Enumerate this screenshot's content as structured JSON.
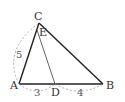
{
  "diagram": {
    "type": "triangle",
    "points": {
      "A": "A",
      "B": "B",
      "C": "C",
      "D": "D",
      "E": "E"
    },
    "segments": [
      "AB",
      "BC",
      "CA",
      "ED"
    ],
    "measures": {
      "AC": "5",
      "AD": "3",
      "DB": "4"
    }
  }
}
